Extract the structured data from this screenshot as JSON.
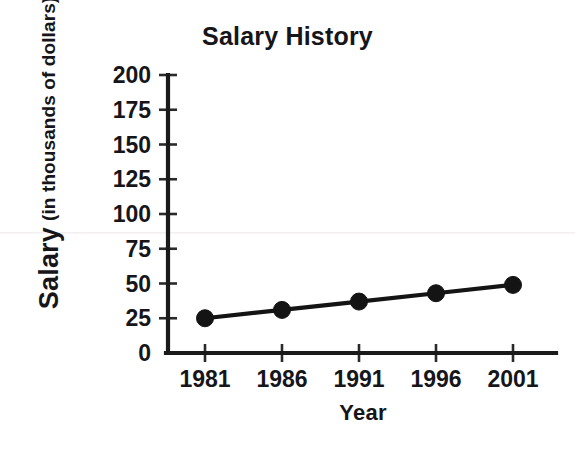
{
  "chart_data": {
    "type": "line",
    "title": "Salary History",
    "xlabel": "Year",
    "ylabel": "Salary",
    "ylabel_sub": "(in thousands of dollars)",
    "categories": [
      "1981",
      "1986",
      "1991",
      "1996",
      "2001"
    ],
    "x": [
      1981,
      1986,
      1991,
      1996,
      2001
    ],
    "values": [
      25,
      31,
      37,
      43,
      49
    ],
    "series": [
      {
        "name": "Salary",
        "values": [
          25,
          31,
          37,
          43,
          49
        ]
      }
    ],
    "ylim": [
      0,
      200
    ],
    "y_ticks": [
      0,
      25,
      50,
      75,
      100,
      125,
      150,
      175,
      200
    ],
    "y_tick_labels": [
      "0",
      "25",
      "50",
      "75",
      "100",
      "125",
      "150",
      "175",
      "200"
    ],
    "x_tick_labels": [
      "1981",
      "1986",
      "1991",
      "1996",
      "2001"
    ],
    "grid": false,
    "legend": false,
    "marker": "circle",
    "line_color": "#141414",
    "marker_color": "#141414",
    "background_color": "#ffffff",
    "text_color": "#16161a"
  }
}
